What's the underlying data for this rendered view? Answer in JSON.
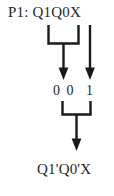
{
  "diagram": {
    "title_label": "P1: Q1Q0X",
    "result_label": "Q1'Q0'X",
    "mid_left_label": "0 0",
    "mid_right_label": "1",
    "ink_color": "#1a1a1a",
    "background_color": "#ffffff",
    "nodes": [
      {
        "name": "source-expression",
        "text": "P1: Q1Q0X"
      },
      {
        "name": "mid-left-values",
        "text": "0 0"
      },
      {
        "name": "mid-right-value",
        "text": "1"
      },
      {
        "name": "result-expression",
        "text": "Q1'Q0'X"
      }
    ],
    "connectors": [
      {
        "name": "upper-merge-bracket",
        "from": "Q1Q0",
        "to": "0 0"
      },
      {
        "name": "upper-merge-arrow",
        "to": "0 0"
      },
      {
        "name": "straight-passthrough-arrow",
        "from": "X",
        "to": "1"
      },
      {
        "name": "lower-merge-bracket",
        "from": "0 0 and 1",
        "to": "Q1'Q0'X"
      },
      {
        "name": "lower-merge-arrow",
        "to": "Q1'Q0'X"
      }
    ]
  }
}
